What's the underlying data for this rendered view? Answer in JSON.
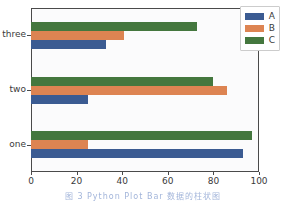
{
  "chart_data": {
    "type": "bar",
    "orientation": "horizontal",
    "title": "",
    "xlabel": "",
    "ylabel": "",
    "categories": [
      "one",
      "two",
      "three"
    ],
    "series": [
      {
        "name": "A",
        "color": "#3b5b92",
        "values": [
          93,
          25,
          33
        ]
      },
      {
        "name": "B",
        "color": "#dd8452",
        "values": [
          25,
          86,
          41
        ]
      },
      {
        "name": "C",
        "color": "#44773e",
        "values": [
          97,
          80,
          73
        ]
      }
    ],
    "xlim": [
      0,
      100
    ],
    "xticks": [
      0,
      20,
      40,
      60,
      80,
      100
    ],
    "xticklabels": [
      "0",
      "20",
      "40",
      "60",
      "80",
      "100"
    ],
    "yticklabels_top_to_bottom": [
      "three",
      "two",
      "one"
    ],
    "grid": false,
    "legend_position": "upper right",
    "legend_entries": [
      "A",
      "B",
      "C"
    ]
  },
  "caption": {
    "text": "图 3  Python  Plot  Bar   数据的柱状图"
  }
}
